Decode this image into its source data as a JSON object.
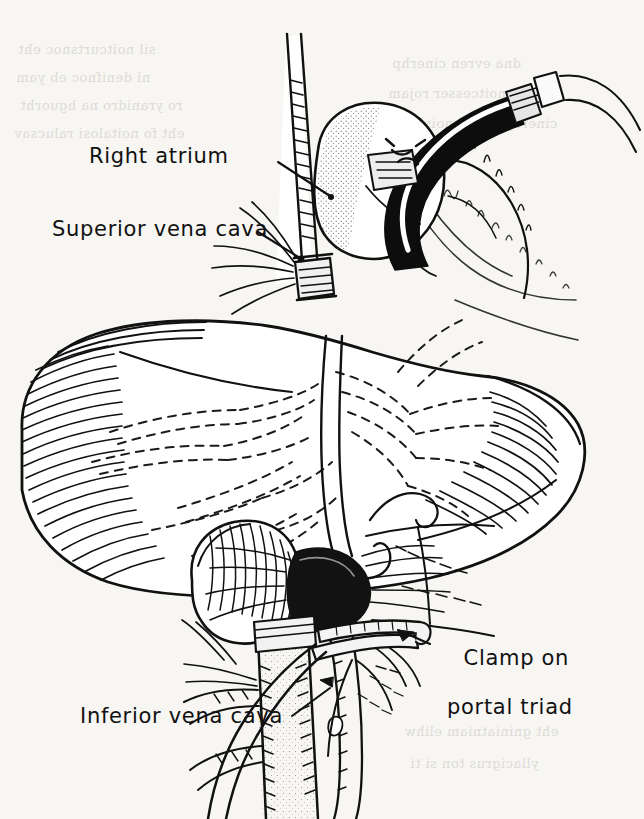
{
  "figure": {
    "kind": "line-drawing",
    "background_color": "#f7f6f3",
    "ink_color": "#111111",
    "width": 644,
    "height": 819
  },
  "labels": {
    "right_atrium": "Right atrium",
    "superior_vena_cava": "Superior vena cava",
    "inferior_vena_cava": "Inferior vena cava",
    "clamp_line1": "Clamp on",
    "clamp_line2": "portal triad"
  },
  "bleed_through": {
    "note": "faint mirrored text showing through from the reverse side of the page",
    "lines": [
      "sil noitcurtsnoc eht",
      "ni denifnoc eb yam",
      "ro yranidro na hguorht",
      "eht fo noitalosi ralucsav",
      "dna evren cinerhp",
      "eht fo noitcesser rojam",
      "cinerhp eht fo noisivid",
      "eht gniniatniam elihw",
      "yllacigrus ton si ti"
    ]
  }
}
